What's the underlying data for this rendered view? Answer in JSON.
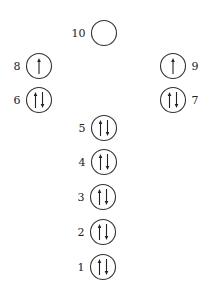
{
  "diagram": {
    "type": "orbital-electron-configuration",
    "orbitals": [
      {
        "label": "1",
        "cx": 103,
        "cy": 267,
        "electrons": "paired",
        "label_side": "left"
      },
      {
        "label": "2",
        "cx": 103,
        "cy": 232,
        "electrons": "paired",
        "label_side": "left"
      },
      {
        "label": "3",
        "cx": 103,
        "cy": 197,
        "electrons": "paired",
        "label_side": "left"
      },
      {
        "label": "4",
        "cx": 104,
        "cy": 162,
        "electrons": "paired",
        "label_side": "left"
      },
      {
        "label": "5",
        "cx": 104,
        "cy": 128,
        "electrons": "paired",
        "label_side": "left"
      },
      {
        "label": "6",
        "cx": 39,
        "cy": 100,
        "electrons": "paired",
        "label_side": "left"
      },
      {
        "label": "7",
        "cx": 173,
        "cy": 100,
        "electrons": "paired",
        "label_side": "right"
      },
      {
        "label": "8",
        "cx": 39,
        "cy": 66,
        "electrons": "single-up",
        "label_side": "left"
      },
      {
        "label": "9",
        "cx": 173,
        "cy": 66,
        "electrons": "single-up",
        "label_side": "right"
      },
      {
        "label": "10",
        "cx": 104,
        "cy": 33,
        "electrons": "empty",
        "label_side": "left"
      }
    ],
    "orbital_radius": 12.5,
    "colors": {
      "stroke": "#333333",
      "text": "#222222",
      "background": "#ffffff"
    }
  }
}
